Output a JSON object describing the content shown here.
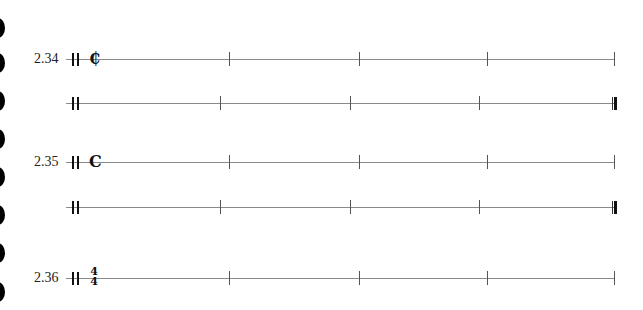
{
  "binder_holes": [
    1,
    2,
    3,
    4,
    5,
    6,
    7,
    8
  ],
  "examples": [
    {
      "label": "2.34",
      "time_signature": {
        "type": "cut-time",
        "symbol": "₵"
      },
      "measures": 4
    },
    {
      "label": "",
      "time_signature": null,
      "measures": 4,
      "ending": "final-barline"
    },
    {
      "label": "2.35",
      "time_signature": {
        "type": "common-time",
        "symbol": "C"
      },
      "measures": 4
    },
    {
      "label": "",
      "time_signature": null,
      "measures": 4,
      "ending": "final-barline"
    },
    {
      "label": "2.36",
      "time_signature": {
        "type": "fraction",
        "numerator": "4",
        "denominator": "4"
      },
      "measures": 4
    }
  ],
  "colors": {
    "ink": "#111111",
    "staff": "#8a8a8a"
  }
}
